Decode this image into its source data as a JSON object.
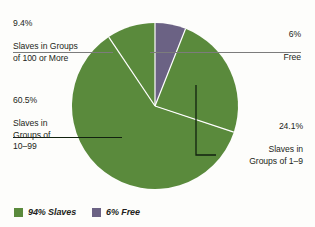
{
  "chart_data": {
    "type": "pie",
    "title": "",
    "subtitle": "",
    "xlabel": "",
    "ylabel": "",
    "grid": false,
    "legend_position": "bottom-left",
    "colors": {
      "slaves_green": "#5a8a3c",
      "free_purple": "#6b6284",
      "text": "#231f20",
      "leader_light": "#8a8a8a",
      "leader_dark": "#1b2a1b",
      "background": "#fdfdfb",
      "wedge_divider": "#ffffff"
    },
    "categories": [
      "Slaves in Groups of 100 or More",
      "Slaves in Groups of 10-99",
      "Slaves in Groups of 1-9",
      "Free"
    ],
    "values": [
      9.4,
      60.5,
      24.1,
      6.0
    ],
    "series": [
      {
        "name": "Share of population",
        "values": [
          9.4,
          60.5,
          24.1,
          6.0
        ]
      }
    ],
    "annotations": [
      "9.4% Slaves in Groups of 100 or More",
      "60.5% Slaves in Groups of 10-99",
      "24.1% Slaves in Groups of 1-9",
      "6% Free"
    ]
  },
  "callouts": {
    "large_groups": {
      "percent": "9.4%",
      "description": "Slaves in Groups\nof 100 or More"
    },
    "mid_groups": {
      "percent": "60.5%",
      "description": "Slaves in\nGroups of\n10–99"
    },
    "small_groups": {
      "percent": "24.1%",
      "description": "Slaves in\nGroups of 1–9"
    },
    "free": {
      "percent": "6%",
      "description": "Free"
    }
  },
  "legend": {
    "items": [
      {
        "label": "94% Slaves",
        "color": "#5a8a3c",
        "swatch_name": "legend-swatch-slaves"
      },
      {
        "label": "6% Free",
        "color": "#6b6284",
        "swatch_name": "legend-swatch-free"
      }
    ]
  }
}
